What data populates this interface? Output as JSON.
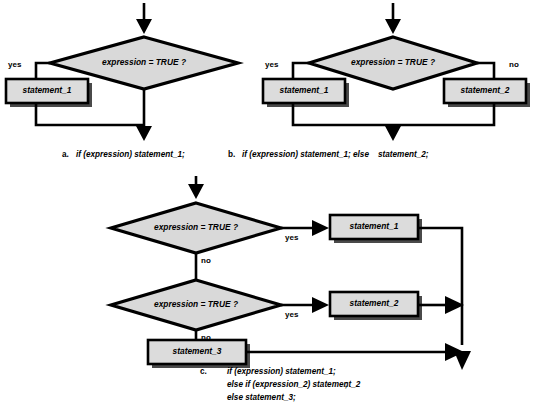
{
  "figure": {
    "background_color": "#ffffff",
    "shape_fill": "#d9d9d9",
    "box_fill": "#dcdcdc",
    "line_color": "#000000"
  },
  "panels": [
    {
      "id": "panel-a",
      "marker": "a.",
      "caption_lines": [
        {
          "text": "if (expression) statement_1;"
        }
      ],
      "decisions": [
        {
          "id": "a-decision-1",
          "label": "expression = TRUE ?"
        }
      ],
      "statements": [
        {
          "id": "a-statement-1",
          "label": "statement_1"
        }
      ],
      "branch_labels": [
        {
          "id": "a-branch-yes",
          "label": "yes"
        }
      ]
    },
    {
      "id": "panel-b",
      "marker": "b.",
      "caption_lines": [
        {
          "text": "if (expression) statement_1; else"
        },
        {
          "text": "statement_2;"
        }
      ],
      "decisions": [
        {
          "id": "b-decision-1",
          "label": "expression = TRUE ?"
        }
      ],
      "statements": [
        {
          "id": "b-statement-1",
          "label": "statement_1"
        },
        {
          "id": "b-statement-2",
          "label": "statement_2"
        }
      ],
      "branch_labels": [
        {
          "id": "b-branch-yes",
          "label": "yes"
        },
        {
          "id": "b-branch-no",
          "label": "no"
        }
      ]
    },
    {
      "id": "panel-c",
      "marker": "c.",
      "caption_lines": [
        {
          "text": "if (expression) statement_1;"
        },
        {
          "text": "else if (expression_2) statement_2"
        },
        {
          "text": ";"
        },
        {
          "text": "else statement_3;"
        }
      ],
      "decisions": [
        {
          "id": "c-decision-1",
          "label": "expression = TRUE ?"
        },
        {
          "id": "c-decision-2",
          "label": "expression = TRUE ?"
        }
      ],
      "statements": [
        {
          "id": "c-statement-1",
          "label": "statement_1"
        },
        {
          "id": "c-statement-2",
          "label": "statement_2"
        },
        {
          "id": "c-statement-3",
          "label": "statement_3"
        }
      ],
      "branch_labels": [
        {
          "id": "c-branch-yes-1",
          "label": "yes"
        },
        {
          "id": "c-branch-no-1",
          "label": "no"
        },
        {
          "id": "c-branch-yes-2",
          "label": "yes"
        },
        {
          "id": "c-branch-no-2",
          "label": "no"
        }
      ]
    }
  ]
}
